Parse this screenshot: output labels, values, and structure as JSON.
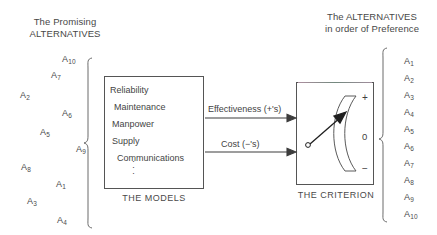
{
  "headings": {
    "left": "The Promising\nALTERNATIVES",
    "right": "The ALTERNATIVES\nin order of Preference"
  },
  "left_alternatives": [
    {
      "label": "A",
      "sub": "10",
      "x": 62,
      "y": 54
    },
    {
      "label": "A",
      "sub": "7",
      "x": 51,
      "y": 70
    },
    {
      "label": "A",
      "sub": "2",
      "x": 20,
      "y": 90
    },
    {
      "label": "A",
      "sub": "6",
      "x": 62,
      "y": 108
    },
    {
      "label": "A",
      "sub": "5",
      "x": 40,
      "y": 127
    },
    {
      "label": "A",
      "sub": "9",
      "x": 76,
      "y": 144
    },
    {
      "label": "A",
      "sub": "8",
      "x": 21,
      "y": 162
    },
    {
      "label": "A",
      "sub": "1",
      "x": 56,
      "y": 179
    },
    {
      "label": "A",
      "sub": "3",
      "x": 27,
      "y": 196
    },
    {
      "label": "A",
      "sub": "4",
      "x": 57,
      "y": 215
    }
  ],
  "right_alternatives": [
    {
      "label": "A",
      "sub": "1",
      "x": 404,
      "y": 56
    },
    {
      "label": "A",
      "sub": "2",
      "x": 404,
      "y": 73
    },
    {
      "label": "A",
      "sub": "3",
      "x": 404,
      "y": 90
    },
    {
      "label": "A",
      "sub": "4",
      "x": 404,
      "y": 107
    },
    {
      "label": "A",
      "sub": "5",
      "x": 404,
      "y": 124
    },
    {
      "label": "A",
      "sub": "6",
      "x": 404,
      "y": 141
    },
    {
      "label": "A",
      "sub": "7",
      "x": 404,
      "y": 158
    },
    {
      "label": "A",
      "sub": "8",
      "x": 404,
      "y": 175
    },
    {
      "label": "A",
      "sub": "9",
      "x": 404,
      "y": 192
    },
    {
      "label": "A",
      "sub": "10",
      "x": 404,
      "y": 209
    }
  ],
  "models_box": {
    "caption": "THE MODELS",
    "lines": [
      {
        "text": "Reliability",
        "x": 110,
        "y": 85
      },
      {
        "text": "Maintenance",
        "x": 114,
        "y": 102
      },
      {
        "text": "Manpower",
        "x": 112,
        "y": 119
      },
      {
        "text": "Supply",
        "x": 112,
        "y": 136
      },
      {
        "text": "Communications",
        "x": 117,
        "y": 153
      }
    ],
    "continuation": "⋮"
  },
  "criterion_box": {
    "caption": "THE CRITERION",
    "gauge": {
      "plus": "+",
      "zero": "0",
      "minus": "−"
    }
  },
  "flows": [
    {
      "name": "effectiveness",
      "label": "Effectiveness (+'s)"
    },
    {
      "name": "cost",
      "label": "Cost   (−'s)"
    }
  ],
  "colors": {
    "stroke": "#555555",
    "text": "#444444",
    "background": "#ffffff"
  }
}
